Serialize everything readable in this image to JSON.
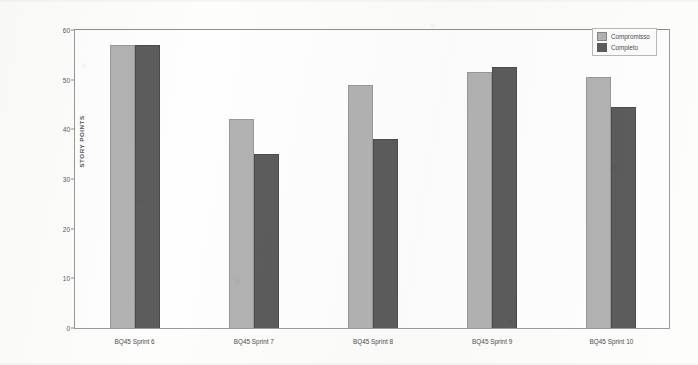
{
  "chart_data": {
    "type": "bar",
    "title": "",
    "xlabel": "",
    "ylabel": "STORY POINTS",
    "ylim": [
      0,
      60
    ],
    "yticks": [
      0,
      10,
      20,
      30,
      40,
      50,
      60
    ],
    "grid": false,
    "legend_position": "top-right",
    "categories": [
      "BQ45 Sprint 6",
      "BQ45 Sprint 7",
      "BQ45 Sprint 8",
      "BQ45 Sprint 9",
      "BQ45 Sprint 10"
    ],
    "series": [
      {
        "name": "Compromisso",
        "color": "#b2b2b2",
        "values": [
          57,
          42,
          49,
          51.5,
          50.5
        ]
      },
      {
        "name": "Completo",
        "color": "#5c5c5c",
        "values": [
          57,
          35,
          38,
          52.5,
          44.5
        ]
      }
    ]
  },
  "legend": {
    "items": [
      {
        "label": "Compromisso"
      },
      {
        "label": "Completo"
      }
    ]
  }
}
